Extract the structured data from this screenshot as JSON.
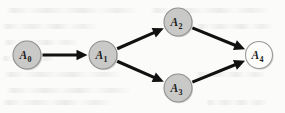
{
  "figure": {
    "type": "directed-acyclic-graph",
    "background_color": "#fbfbfa",
    "width": 285,
    "height": 113,
    "has_background_bleedthrough_text": true
  },
  "style": {
    "node_fill": "#c9c9c7",
    "node_fill_terminal": "#fcfcfb",
    "node_stroke": "#8f8f8d",
    "edge_color": "#111111",
    "label_color": "#1b1b1b"
  },
  "nodes": [
    {
      "id": "A0",
      "base": "A",
      "sub": "0",
      "cx": 27,
      "cy": 55,
      "r": 14,
      "fill_style": "filled"
    },
    {
      "id": "A1",
      "base": "A",
      "sub": "1",
      "cx": 103,
      "cy": 55,
      "r": 14,
      "fill_style": "filled"
    },
    {
      "id": "A2",
      "base": "A",
      "sub": "2",
      "cx": 178,
      "cy": 22,
      "r": 14,
      "fill_style": "filled"
    },
    {
      "id": "A3",
      "base": "A",
      "sub": "3",
      "cx": 178,
      "cy": 88,
      "r": 14,
      "fill_style": "filled"
    },
    {
      "id": "A4",
      "base": "A",
      "sub": "4",
      "cx": 259,
      "cy": 55,
      "r": 13.5,
      "fill_style": "open"
    }
  ],
  "edges": [
    {
      "id": "A0-A1",
      "from": "A0",
      "to": "A1",
      "directed": true
    },
    {
      "id": "A1-A2",
      "from": "A1",
      "to": "A2",
      "directed": true
    },
    {
      "id": "A1-A3",
      "from": "A1",
      "to": "A3",
      "directed": true
    },
    {
      "id": "A2-A4",
      "from": "A2",
      "to": "A4",
      "directed": true
    },
    {
      "id": "A3-A4",
      "from": "A3",
      "to": "A4",
      "directed": true
    }
  ],
  "bleed_lines": [
    {
      "top": 8,
      "left": 6,
      "width": 132
    },
    {
      "top": 8,
      "left": 150,
      "width": 120
    },
    {
      "top": 24,
      "left": 2,
      "width": 96
    },
    {
      "top": 24,
      "left": 196,
      "width": 78
    },
    {
      "top": 40,
      "left": 4,
      "width": 74
    },
    {
      "top": 56,
      "left": 2,
      "width": 52
    },
    {
      "top": 72,
      "left": 4,
      "width": 118
    },
    {
      "top": 72,
      "left": 196,
      "width": 70
    },
    {
      "top": 88,
      "left": 6,
      "width": 126
    },
    {
      "top": 100,
      "left": 2,
      "width": 110
    },
    {
      "top": 100,
      "left": 206,
      "width": 62
    }
  ]
}
